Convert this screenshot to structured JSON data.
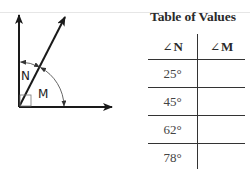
{
  "diagram": {
    "labels": {
      "angle_n": "N",
      "angle_m": "M"
    },
    "rays": [
      {
        "name": "vertical-ray",
        "direction_deg": 90
      },
      {
        "name": "diagonal-ray",
        "direction_deg": 63
      },
      {
        "name": "horizontal-ray",
        "direction_deg": 0
      }
    ],
    "right_angle_marker": true,
    "colors": {
      "stroke": "#1a1a1a",
      "arc": "#555555"
    }
  },
  "table": {
    "title": "Table of Values",
    "angle_symbol": "∠",
    "headers": [
      "N",
      "M"
    ],
    "rows": [
      {
        "n": "25°",
        "m": ""
      },
      {
        "n": "45°",
        "m": ""
      },
      {
        "n": "62°",
        "m": ""
      },
      {
        "n": "78°",
        "m": ""
      }
    ]
  }
}
